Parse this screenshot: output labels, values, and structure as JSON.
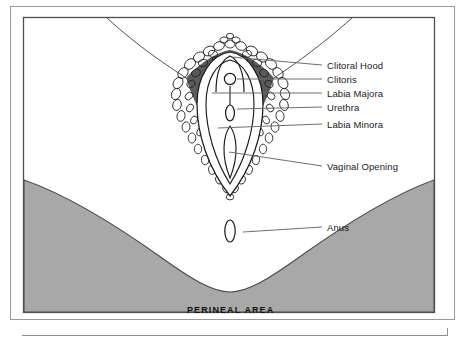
{
  "figure": {
    "frame": {
      "outer_border_color": "#8c8c8c",
      "inner_border_color": "#555555",
      "background_color": "#ffffff"
    },
    "colors": {
      "skin_shaded": "#a8a8a8",
      "skin_shaded_edge": "#4a4a4a",
      "ink": "#1a1a1a",
      "leader_line": "#666666",
      "hair": "#2b2b2b"
    },
    "region_caption": "PERINEAL AREA",
    "labels": [
      {
        "id": "clitoral-hood",
        "text": "Clitoral Hood",
        "x": 327,
        "y": 61
      },
      {
        "id": "clitoris",
        "text": "Clitoris",
        "x": 327,
        "y": 75
      },
      {
        "id": "labia-majora",
        "text": "Labia Majora",
        "x": 327,
        "y": 89
      },
      {
        "id": "urethra",
        "text": "Urethra",
        "x": 327,
        "y": 103
      },
      {
        "id": "labia-minora",
        "text": "Labia Minora",
        "x": 327,
        "y": 120
      },
      {
        "id": "vaginal-opening",
        "text": "Vaginal Opening",
        "x": 327,
        "y": 162
      },
      {
        "id": "anus",
        "text": "Anus",
        "x": 327,
        "y": 223
      }
    ],
    "leader_lines": [
      {
        "id": "leader-clitoral-hood",
        "x1": 322,
        "y1": 65,
        "x2": 232,
        "y2": 57
      },
      {
        "id": "leader-clitoris",
        "x1": 322,
        "y1": 79,
        "x2": 238,
        "y2": 79
      },
      {
        "id": "leader-labia-majora",
        "x1": 322,
        "y1": 93,
        "x2": 213,
        "y2": 93
      },
      {
        "id": "leader-urethra",
        "x1": 322,
        "y1": 107,
        "x2": 240,
        "y2": 107
      },
      {
        "id": "leader-labia-minora",
        "x1": 322,
        "y1": 124,
        "x2": 219,
        "y2": 128
      },
      {
        "id": "leader-vaginal-opening",
        "x1": 322,
        "y1": 166,
        "x2": 228,
        "y2": 152
      },
      {
        "id": "leader-anus",
        "x1": 322,
        "y1": 227,
        "x2": 245,
        "y2": 232
      }
    ]
  }
}
